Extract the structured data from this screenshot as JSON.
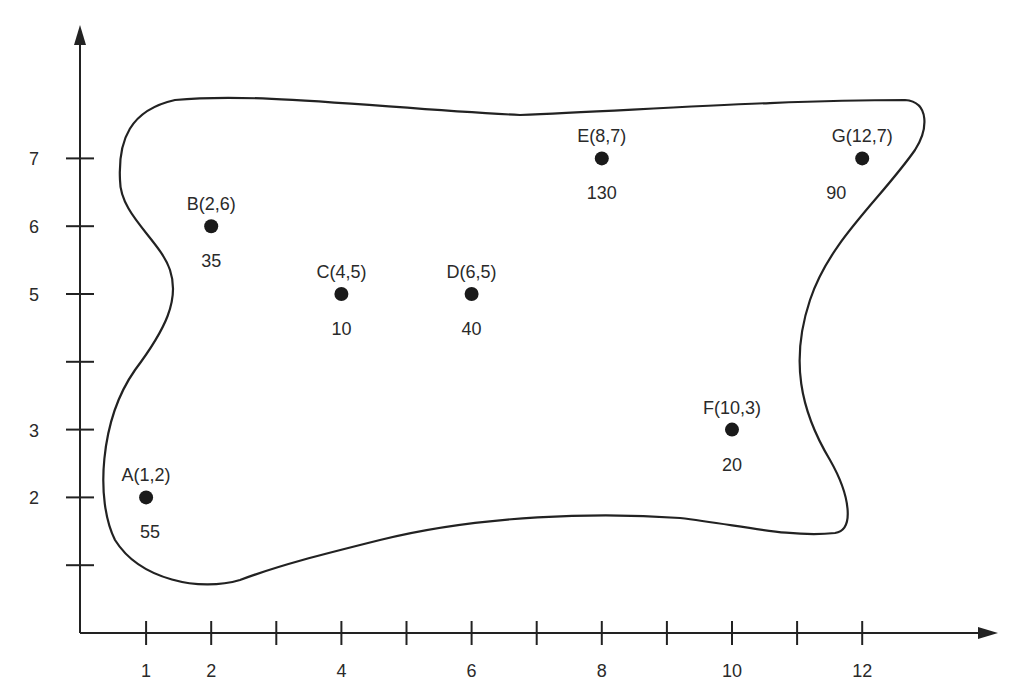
{
  "figure": {
    "top_text_cropped": "",
    "axes": {
      "x_ticks": [
        {
          "value": 1,
          "label": "1"
        },
        {
          "value": 2,
          "label": "2"
        },
        {
          "value": 3,
          "label": ""
        },
        {
          "value": 4,
          "label": "4"
        },
        {
          "value": 5,
          "label": ""
        },
        {
          "value": 6,
          "label": "6"
        },
        {
          "value": 7,
          "label": ""
        },
        {
          "value": 8,
          "label": "8"
        },
        {
          "value": 9,
          "label": ""
        },
        {
          "value": 10,
          "label": "10"
        },
        {
          "value": 11,
          "label": ""
        },
        {
          "value": 12,
          "label": "12"
        }
      ],
      "y_ticks": [
        {
          "value": 1,
          "label": ""
        },
        {
          "value": 2,
          "label": "2"
        },
        {
          "value": 3,
          "label": "3"
        },
        {
          "value": 4,
          "label": ""
        },
        {
          "value": 5,
          "label": "5"
        },
        {
          "value": 6,
          "label": "6"
        },
        {
          "value": 7,
          "label": "7"
        }
      ]
    },
    "points": [
      {
        "id": "A",
        "label": "A(1,2)",
        "x": 1,
        "y": 2,
        "value": "55"
      },
      {
        "id": "B",
        "label": "B(2,6)",
        "x": 2,
        "y": 6,
        "value": "35"
      },
      {
        "id": "C",
        "label": "C(4,5)",
        "x": 4,
        "y": 5,
        "value": "10"
      },
      {
        "id": "D",
        "label": "D(6,5)",
        "x": 6,
        "y": 5,
        "value": "40"
      },
      {
        "id": "E",
        "label": "E(8,7)",
        "x": 8,
        "y": 7,
        "value": "130"
      },
      {
        "id": "F",
        "label": "F(10,3)",
        "x": 10,
        "y": 3,
        "value": "20"
      },
      {
        "id": "G",
        "label": "G(12,7)",
        "x": 12,
        "y": 7,
        "value": "90"
      }
    ],
    "colors": {
      "ink": "#222222",
      "background": "#ffffff"
    }
  },
  "chart_data": {
    "type": "scatter",
    "title": "",
    "xlabel": "",
    "ylabel": "",
    "xlim": [
      0,
      13.5
    ],
    "ylim": [
      0,
      9
    ],
    "grid": false,
    "x_tick_labels": [
      "1",
      "2",
      "4",
      "6",
      "8",
      "10",
      "12"
    ],
    "y_tick_labels": [
      "2",
      "3",
      "5",
      "6",
      "7"
    ],
    "series": [
      {
        "name": "locations",
        "points": [
          {
            "label": "A",
            "x": 1,
            "y": 2,
            "weight": 55
          },
          {
            "label": "B",
            "x": 2,
            "y": 6,
            "weight": 35
          },
          {
            "label": "C",
            "x": 4,
            "y": 5,
            "weight": 10
          },
          {
            "label": "D",
            "x": 6,
            "y": 5,
            "weight": 40
          },
          {
            "label": "E",
            "x": 8,
            "y": 7,
            "weight": 130
          },
          {
            "label": "F",
            "x": 10,
            "y": 3,
            "weight": 20
          },
          {
            "label": "G",
            "x": 12,
            "y": 7,
            "weight": 90
          }
        ]
      }
    ],
    "annotations": [
      "Closed irregular boundary enclosing all points"
    ]
  }
}
